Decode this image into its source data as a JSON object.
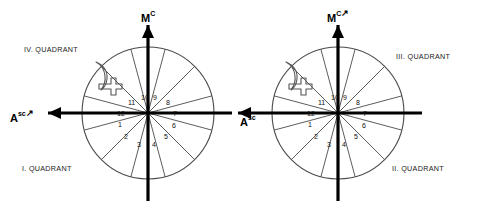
{
  "figure": {
    "background_color": "#ffffff",
    "line_color": "#000000",
    "thin_line_color": "#4a4a4a"
  },
  "charts": [
    {
      "id": "left-wheel",
      "center": {
        "x": 148,
        "y": 113
      },
      "radius": 66,
      "axis_labels": {
        "mc_base": "M",
        "mc_sup": "C",
        "asc_base": "A",
        "asc_sup": "sc",
        "mc_arrow": "",
        "asc_arrow": "↗"
      },
      "quadrant_labels": [
        {
          "text": "IV. QUADRANT",
          "x": 24,
          "y": 45
        },
        {
          "text": "I. QUADRANT",
          "x": 22,
          "y": 164
        }
      ],
      "house_numbers": [
        {
          "label": "1",
          "x": 118,
          "y": 121
        },
        {
          "label": "2",
          "x": 124,
          "y": 133
        },
        {
          "label": "3",
          "x": 137,
          "y": 141
        },
        {
          "label": "4",
          "x": 152,
          "y": 141
        },
        {
          "label": "5",
          "x": 164,
          "y": 133
        },
        {
          "label": "6",
          "x": 172,
          "y": 122
        },
        {
          "label": "7",
          "x": 173,
          "y": 110
        },
        {
          "label": "8",
          "x": 166,
          "y": 99
        },
        {
          "label": "9",
          "x": 153,
          "y": 94
        },
        {
          "label": "10",
          "x": 141,
          "y": 94
        },
        {
          "label": "11",
          "x": 128,
          "y": 99
        },
        {
          "label": "12",
          "x": 117,
          "y": 110
        }
      ],
      "glyphs": [
        {
          "name": "moon-glyph",
          "x": 96,
          "y": 62
        },
        {
          "name": "cross-glyph",
          "x": 102,
          "y": 78
        }
      ]
    },
    {
      "id": "right-wheel",
      "center": {
        "x": 338,
        "y": 113
      },
      "radius": 66,
      "axis_labels": {
        "mc_base": "M",
        "mc_sup": "C",
        "asc_base": "A",
        "asc_sup": "sc",
        "mc_arrow": "↗",
        "asc_arrow": ""
      },
      "quadrant_labels": [
        {
          "text": "III. QUADRANT",
          "x": 396,
          "y": 52
        },
        {
          "text": "II. QUADRANT",
          "x": 392,
          "y": 164
        }
      ],
      "house_numbers": [
        {
          "label": "1",
          "x": 308,
          "y": 121
        },
        {
          "label": "2",
          "x": 314,
          "y": 133
        },
        {
          "label": "3",
          "x": 327,
          "y": 141
        },
        {
          "label": "4",
          "x": 342,
          "y": 141
        },
        {
          "label": "5",
          "x": 354,
          "y": 133
        },
        {
          "label": "6",
          "x": 362,
          "y": 122
        },
        {
          "label": "7",
          "x": 363,
          "y": 110
        },
        {
          "label": "8",
          "x": 356,
          "y": 99
        },
        {
          "label": "9",
          "x": 343,
          "y": 94
        },
        {
          "label": "10",
          "x": 331,
          "y": 94
        },
        {
          "label": "11",
          "x": 318,
          "y": 99
        },
        {
          "label": "12",
          "x": 307,
          "y": 110
        }
      ],
      "glyphs": [
        {
          "name": "moon-glyph",
          "x": 286,
          "y": 62
        },
        {
          "name": "cross-glyph",
          "x": 292,
          "y": 78
        }
      ]
    }
  ],
  "label_positions": {
    "left_mc": {
      "x": 141,
      "y": 8
    },
    "left_asc": {
      "x": 10,
      "y": 108
    },
    "right_mc": {
      "x": 327,
      "y": 8
    },
    "right_asc": {
      "x": 240,
      "y": 112
    }
  }
}
